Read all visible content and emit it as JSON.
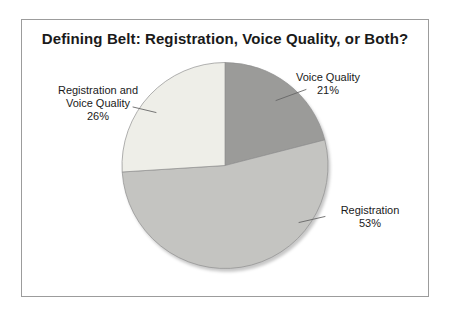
{
  "page": {
    "background_color": "#ffffff",
    "frame_border_color": "#9c9c9c"
  },
  "chart_data": {
    "type": "pie",
    "title": "Defining Belt: Registration, Voice Quality, or Both?",
    "start_angle_deg": 0,
    "direction": "clockwise",
    "legend": "none",
    "labels_position": "outside-with-leader-lines",
    "stroke_color": "#8f8f8f",
    "leader_line_color": "#666666",
    "slices": [
      {
        "label": "Voice Quality",
        "percent": 21,
        "color": "#9b9b99"
      },
      {
        "label": "Registration",
        "percent": 53,
        "color": "#c4c4c1"
      },
      {
        "label": "Registration and Voice Quality",
        "percent": 26,
        "color": "#eeeee8"
      }
    ],
    "labels": [
      {
        "text": "Voice Quality\n21%"
      },
      {
        "text": "Registration\n53%"
      },
      {
        "text": "Registration and\nVoice Quality\n26%"
      }
    ]
  }
}
